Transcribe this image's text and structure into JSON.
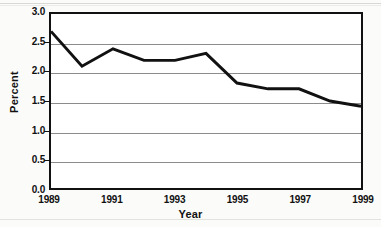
{
  "chart_data": {
    "type": "line",
    "title": "",
    "xlabel": "Year",
    "ylabel": "Percent",
    "x": [
      1989,
      1990,
      1991,
      1992,
      1993,
      1994,
      1995,
      1996,
      1997,
      1998,
      1999
    ],
    "values": [
      2.7,
      2.1,
      2.4,
      2.2,
      2.2,
      2.32,
      1.81,
      1.71,
      1.71,
      1.5,
      1.41
    ],
    "series": [
      {
        "name": "Percent",
        "values": [
          2.7,
          2.1,
          2.4,
          2.2,
          2.2,
          2.32,
          1.81,
          1.71,
          1.71,
          1.5,
          1.41
        ]
      }
    ],
    "xlim": [
      1989,
      1999
    ],
    "ylim": [
      0.0,
      3.0
    ],
    "xticks": [
      1989,
      1991,
      1993,
      1995,
      1997,
      1999
    ],
    "xtick_labels": [
      "1989",
      "1991",
      "1993",
      "1995",
      "1997",
      "1999"
    ],
    "yticks": [
      0.0,
      0.5,
      1.0,
      1.5,
      2.0,
      2.5,
      3.0
    ],
    "ytick_labels": [
      "0.0",
      "0.5",
      "1.0",
      "1.5",
      "2.0",
      "2.5",
      "3.0"
    ],
    "grid": "horizontal",
    "legend": "none",
    "line_color": "#111111",
    "line_width": 3,
    "grid_color": "#8c8c8c",
    "frame_color": "#111111",
    "plot_background": "#ffffff",
    "figure_background": "#fbfbf9"
  }
}
